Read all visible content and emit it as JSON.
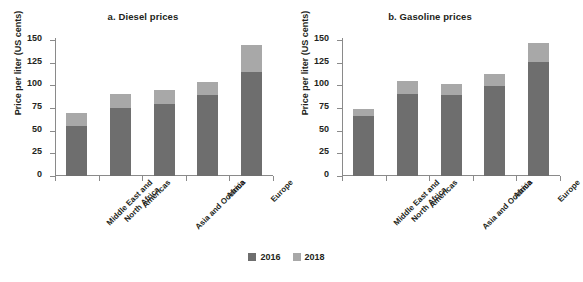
{
  "figure": {
    "legend": {
      "position": "bottom-center",
      "entries": [
        {
          "label": "2016",
          "color": "#6e6e6e"
        },
        {
          "label": "2018",
          "color": "#a8a8a8"
        }
      ]
    }
  },
  "chart_data": [
    {
      "type": "bar",
      "subtype": "stacked",
      "title": "a. Diesel prices",
      "xlabel": "",
      "ylabel": "Price per liter (US cents)",
      "ylim": [
        0,
        150
      ],
      "yticks": [
        0,
        25,
        50,
        75,
        100,
        125,
        150
      ],
      "grid": false,
      "categories": [
        "Middle East and\nNorth Africa",
        "Americas",
        "Asia and Oceania",
        "Africa",
        "Europe"
      ],
      "series": [
        {
          "name": "2016",
          "color": "#6e6e6e",
          "values": [
            55,
            75,
            79,
            89,
            115
          ]
        },
        {
          "name": "2018",
          "color": "#a8a8a8",
          "values": [
            14,
            16,
            16,
            15,
            30
          ]
        }
      ],
      "totals": [
        69,
        91,
        95,
        104,
        145
      ]
    },
    {
      "type": "bar",
      "subtype": "stacked",
      "title": "b. Gasoline prices",
      "xlabel": "",
      "ylabel": "Price per liter (US cents)",
      "ylim": [
        0,
        150
      ],
      "yticks": [
        0,
        25,
        50,
        75,
        100,
        125,
        150
      ],
      "grid": false,
      "categories": [
        "Middle East and\nNorth Africa",
        "Americas",
        "Asia and Oceania",
        "Africa",
        "Europe"
      ],
      "series": [
        {
          "name": "2016",
          "color": "#6e6e6e",
          "values": [
            66,
            90,
            89,
            99,
            126
          ]
        },
        {
          "name": "2018",
          "color": "#a8a8a8",
          "values": [
            8,
            15,
            13,
            13,
            21
          ]
        }
      ],
      "totals": [
        74,
        105,
        102,
        112,
        147
      ]
    }
  ]
}
